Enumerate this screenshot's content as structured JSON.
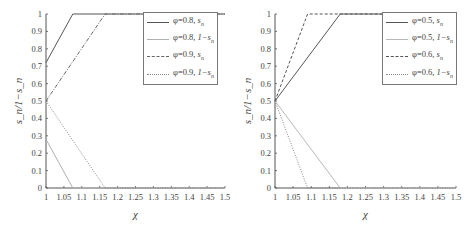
{
  "chart_data": [
    {
      "type": "line",
      "title": "",
      "xlabel": "χ",
      "ylabel": "s_n / 1−s_n",
      "xlim": [
        1,
        1.5
      ],
      "ylim": [
        0,
        1
      ],
      "xticks": [
        "1",
        "1.05",
        "1.1",
        "1.15",
        "1.2",
        "1.25",
        "1.3",
        "1.35",
        "1.4",
        "1.45",
        "1.5"
      ],
      "yticks": [
        "0",
        "0.1",
        "0.2",
        "0.3",
        "0.4",
        "0.5",
        "0.6",
        "0.7",
        "0.8",
        "0.9",
        "1"
      ],
      "grid": false,
      "legend_position": "upper right",
      "series": [
        {
          "name": "φ=0.8, s_n",
          "style": "solid",
          "color": "#555555",
          "x": [
            1,
            1.075,
            1.5
          ],
          "y": [
            0.72,
            1,
            1
          ]
        },
        {
          "name": "φ=0.8, 1−s_n",
          "style": "solid",
          "color": "#b0b0b0",
          "x": [
            1,
            1.075,
            1.5
          ],
          "y": [
            0.28,
            0,
            0
          ]
        },
        {
          "name": "φ=0.9, s_n",
          "style": "dashdot",
          "color": "#666666",
          "x": [
            1,
            1.165,
            1.5
          ],
          "y": [
            0.5,
            1,
            1
          ]
        },
        {
          "name": "φ=0.9, 1−s_n",
          "style": "dotted",
          "color": "#888888",
          "x": [
            1,
            1.165,
            1.5
          ],
          "y": [
            0.5,
            0,
            0
          ]
        }
      ]
    },
    {
      "type": "line",
      "title": "",
      "xlabel": "χ",
      "ylabel": "s_n / 1−s_n",
      "xlim": [
        1,
        1.5
      ],
      "ylim": [
        0,
        1
      ],
      "xticks": [
        "1",
        "1.05",
        "1.1",
        "1.15",
        "1.2",
        "1.25",
        "1.3",
        "1.35",
        "1.4",
        "1.45",
        "1.5"
      ],
      "yticks": [
        "0",
        "0.1",
        "0.2",
        "0.3",
        "0.4",
        "0.5",
        "0.6",
        "0.7",
        "0.8",
        "0.9",
        "1"
      ],
      "grid": false,
      "legend_position": "upper right",
      "series": [
        {
          "name": "φ=0.5, s_n",
          "style": "solid",
          "color": "#555555",
          "x": [
            1,
            1.18,
            1.5
          ],
          "y": [
            0.5,
            1,
            1
          ]
        },
        {
          "name": "φ=0.5, 1−s_n",
          "style": "solid",
          "color": "#b8b8b8",
          "x": [
            1,
            1.18,
            1.5
          ],
          "y": [
            0.5,
            0,
            0
          ]
        },
        {
          "name": "φ=0.6, s_n",
          "style": "dashed",
          "color": "#555555",
          "x": [
            1,
            1.09,
            1.5
          ],
          "y": [
            0.5,
            1,
            1
          ]
        },
        {
          "name": "φ=0.6, 1−s_n",
          "style": "dotted",
          "color": "#888888",
          "x": [
            1,
            1.09,
            1.5
          ],
          "y": [
            0.5,
            0,
            0
          ]
        }
      ]
    }
  ],
  "charts": [
    {
      "xlabel": "χ",
      "ylabel": "s_n/1−s_n",
      "legend": [
        {
          "phi": "φ=0.8, ",
          "var": "s_n"
        },
        {
          "phi": "φ=0.8, ",
          "var": "1−s_n"
        },
        {
          "phi": "φ=0.9, ",
          "var": "s_n"
        },
        {
          "phi": "φ=0.9, ",
          "var": "1−s_n"
        }
      ]
    },
    {
      "xlabel": "χ",
      "ylabel": "s_n/1−s_n",
      "legend": [
        {
          "phi": "φ=0.5, ",
          "var": "s_n"
        },
        {
          "phi": "φ=0.5, ",
          "var": "1−s_n"
        },
        {
          "phi": "φ=0.6, ",
          "var": "s_n"
        },
        {
          "phi": "φ=0.6, ",
          "var": "1−s_n"
        }
      ]
    }
  ]
}
